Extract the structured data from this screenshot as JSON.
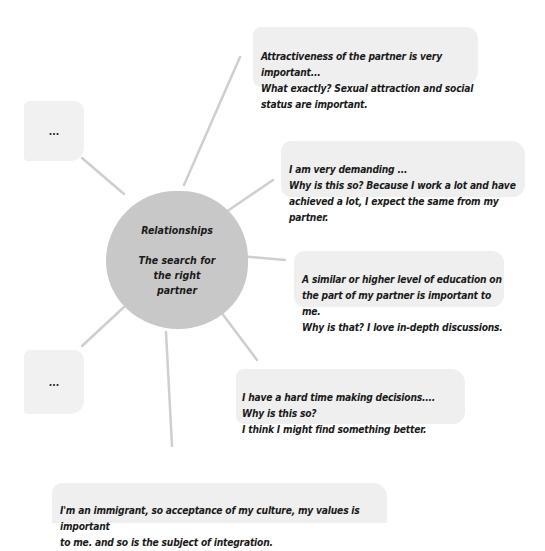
{
  "diagram": {
    "type": "mind-map",
    "center": {
      "title": "Relationships",
      "subtitle": "The search for\nthe right\npartner",
      "fill": "#c8c8c8"
    },
    "nodes": [
      {
        "id": "attractiveness",
        "text": "Attractiveness of the partner is very important...\nWhat exactly? Sexual attraction and social\nstatus are important."
      },
      {
        "id": "demanding",
        "text": "I am very demanding ...\nWhy is this so? Because I work a lot and have\nachieved a lot, I expect the same from my partner."
      },
      {
        "id": "education",
        "text": "A similar or higher level of education on\nthe part of my partner is important to me.\nWhy is that? I love in-depth discussions."
      },
      {
        "id": "decisions",
        "text": "I have a hard time making decisions....\nWhy is this so?\nI think I might find something better."
      },
      {
        "id": "immigrant",
        "text": "I'm an immigrant, so acceptance of my culture, my values is important\nto me. and so is the subject of integration."
      }
    ],
    "placeholders": [
      {
        "id": "placeholder-top",
        "text": "..."
      },
      {
        "id": "placeholder-bottom",
        "text": "..."
      }
    ],
    "colors": {
      "node_fill": "#efefef",
      "line": "#cccccc",
      "text": "#1a1a1a"
    }
  }
}
